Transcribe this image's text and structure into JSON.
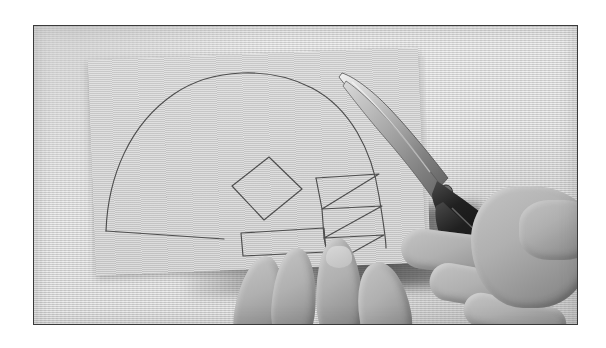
{
  "image": {
    "kind": "photograph",
    "subject": "hands-cutting-paper-template-with-scissors",
    "alt_text": "Black and white photograph of two hands cutting a paper template with scissors",
    "caption": "",
    "palette": {
      "page_background": "#ffffff",
      "frame_border": "#3a3a3a",
      "backdrop": "#d6d6d6",
      "paper": "#c8c8c8",
      "pencil_line": "#4a4a4a",
      "scissor_blade": "#9a9a9a",
      "scissor_handle": "#1a1a1a",
      "skin_highlight": "#c4c4c4",
      "skin_shadow": "#6f6f6f",
      "drop_shadow": "#4a4a4a"
    },
    "frame": {
      "x": 33,
      "y": 25,
      "width": 545,
      "height": 300,
      "border_width": 1
    }
  },
  "objects": {
    "backdrop": {
      "name": "textured-grey-backdrop",
      "description": "light grey woven-texture surface"
    },
    "paper_sheet": {
      "name": "paper-sheet",
      "description": "large rectangular sheet of grey paper laid at a slight angle"
    },
    "paper_sheet_secondary": {
      "name": "paper-sheet-upper-right",
      "description": "second lighter paper panel behind the scissors"
    },
    "template_drawing": {
      "name": "pencil-template-drawing",
      "description": "pencil outline of a dome/semicircle with an inner diamond, a rectangle and a zigzag column",
      "shapes": [
        {
          "id": "dome-outline",
          "label": "dome"
        },
        {
          "id": "diamond",
          "label": "diamond"
        },
        {
          "id": "rectangle",
          "label": "rectangle"
        },
        {
          "id": "zigzag",
          "label": "zigzag"
        }
      ]
    },
    "scissors": {
      "name": "scissors",
      "description": "pair of scissors with long silver blades and black plastic handle loops",
      "blade_color": "#9a9a9a",
      "handle_color": "#1a1a1a"
    },
    "left_hand": {
      "name": "left-hand",
      "description": "fingers of the left hand steadying the paper from beneath"
    },
    "right_hand": {
      "name": "right-hand",
      "description": "right hand gripping the scissor handles, fingers through the loops"
    }
  }
}
